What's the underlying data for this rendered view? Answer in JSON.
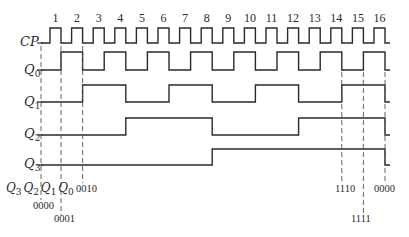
{
  "diagram": {
    "type": "timing-diagram",
    "signals": [
      {
        "id": "cp",
        "label": "CP",
        "sub": ""
      },
      {
        "id": "q0",
        "label": "Q",
        "sub": "0"
      },
      {
        "id": "q1",
        "label": "Q",
        "sub": "1"
      },
      {
        "id": "q2",
        "label": "Q",
        "sub": "2"
      },
      {
        "id": "q3",
        "label": "Q",
        "sub": "3"
      }
    ],
    "pulse_numbers": [
      "1",
      "2",
      "3",
      "4",
      "5",
      "6",
      "7",
      "8",
      "9",
      "10",
      "11",
      "12",
      "13",
      "14",
      "15",
      "16"
    ],
    "state_header": "Q3 Q2 Q1 Q0",
    "state_header_parts": [
      {
        "label": "Q",
        "sub": "3"
      },
      {
        "label": "Q",
        "sub": "2"
      },
      {
        "label": "Q",
        "sub": "1"
      },
      {
        "label": "Q",
        "sub": "0"
      }
    ],
    "state_annotations": [
      {
        "value": "0000",
        "at_pulse": 0
      },
      {
        "value": "0001",
        "at_pulse": 1
      },
      {
        "value": "0010",
        "at_pulse": 2
      },
      {
        "value": "1110",
        "at_pulse": 14
      },
      {
        "value": "1111",
        "at_pulse": 15
      },
      {
        "value": "0000",
        "at_pulse": 16
      }
    ],
    "trigger_edge": "falling",
    "colors": {
      "line": "#2a2a2a",
      "dash": "#555555",
      "background": "#ffffff"
    }
  }
}
